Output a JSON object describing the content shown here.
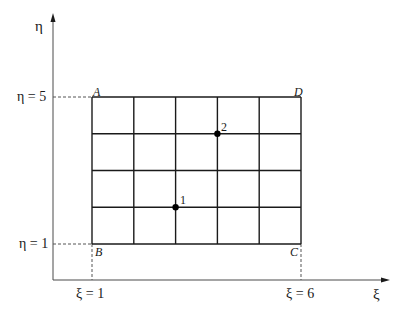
{
  "diagram": {
    "type": "computational grid in transformed coordinates",
    "axes": {
      "horizontal": {
        "label": "ξ",
        "min_tick_label": "ξ = 1",
        "max_tick_label": "ξ = 6"
      },
      "vertical": {
        "label": "η",
        "min_tick_label": "η = 1",
        "max_tick_label": "η = 5"
      }
    },
    "grid": {
      "xi_range": [
        1,
        6
      ],
      "eta_range": [
        1,
        5
      ],
      "columns": 5,
      "rows": 4,
      "line_color": "#1a1a1a"
    },
    "corners": [
      {
        "name": "A",
        "xi": 1,
        "eta": 5
      },
      {
        "name": "B",
        "xi": 1,
        "eta": 1
      },
      {
        "name": "C",
        "xi": 6,
        "eta": 1
      },
      {
        "name": "D",
        "xi": 6,
        "eta": 5
      }
    ],
    "points": [
      {
        "label": "1",
        "xi": 3,
        "eta": 2
      },
      {
        "label": "2",
        "xi": 4,
        "eta": 4
      }
    ]
  }
}
